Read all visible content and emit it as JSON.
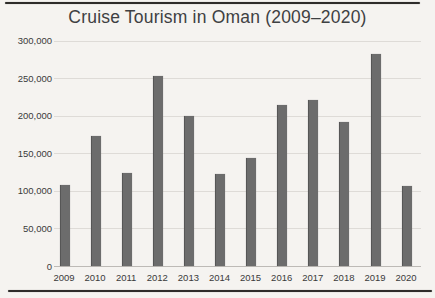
{
  "page": {
    "background_color": "#f5f3f0",
    "top_rule_color": "#2e2c2a",
    "bottom_rule_color": "#2e2c2a"
  },
  "chart_data": {
    "type": "bar",
    "title": "Cruise Tourism in Oman (2009–2020)",
    "xlabel": "",
    "ylabel": "",
    "categories": [
      "2009",
      "2010",
      "2011",
      "2012",
      "2013",
      "2014",
      "2015",
      "2016",
      "2017",
      "2018",
      "2019",
      "2020"
    ],
    "values": [
      108000,
      173000,
      125000,
      254000,
      200000,
      123000,
      144000,
      215000,
      221000,
      192000,
      283000,
      107000
    ],
    "ylim": [
      0,
      300000
    ],
    "y_ticks": [
      0,
      50000,
      100000,
      150000,
      200000,
      250000,
      300000
    ],
    "y_tick_labels": [
      "0",
      "50,000",
      "100,000",
      "150,000",
      "200,000",
      "250,000",
      "300,000"
    ],
    "grid": "horizontal",
    "legend": "none",
    "bar_color": "#6c6c6c",
    "series_name": "Cruise tourists"
  }
}
